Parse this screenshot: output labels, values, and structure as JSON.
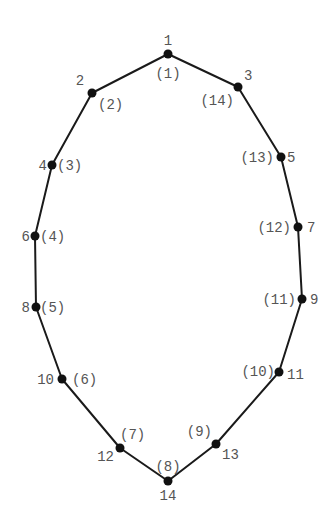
{
  "diagram": {
    "type": "polygon-vertex-numbering",
    "colors": {
      "edge": "#1a1a1a",
      "node": "#111111",
      "label": "#555555",
      "background": "#ffffff"
    },
    "vertices": [
      {
        "id": "v1",
        "x": 168,
        "y": 54,
        "primary": "1",
        "secondary": "(1)",
        "p_dx": 0,
        "p_dy": -9,
        "p_anchor": "middle",
        "s_dx": 0,
        "s_dy": 24,
        "s_anchor": "middle"
      },
      {
        "id": "v2",
        "x": 92,
        "y": 93,
        "primary": "2",
        "secondary": "(2)",
        "p_dx": -12,
        "p_dy": -8,
        "p_anchor": "middle",
        "s_dx": 6,
        "s_dy": 16,
        "s_anchor": "start"
      },
      {
        "id": "v3",
        "x": 238,
        "y": 87,
        "primary": "3",
        "secondary": "(14)",
        "p_dx": 6,
        "p_dy": -7,
        "p_anchor": "start",
        "s_dx": -4,
        "s_dy": 18,
        "s_anchor": "end"
      },
      {
        "id": "v4",
        "x": 52,
        "y": 165,
        "primary": "4",
        "secondary": "(3)",
        "p_dx": -5,
        "p_dy": 5,
        "p_anchor": "end",
        "s_dx": 5,
        "s_dy": 5,
        "s_anchor": "start"
      },
      {
        "id": "v5",
        "x": 281,
        "y": 157,
        "primary": "5",
        "secondary": "(13)",
        "p_dx": 6,
        "p_dy": 5,
        "p_anchor": "start",
        "s_dx": -7,
        "s_dy": 5,
        "s_anchor": "end"
      },
      {
        "id": "v6",
        "x": 35,
        "y": 236,
        "primary": "6",
        "secondary": "(4)",
        "p_dx": -5,
        "p_dy": 5,
        "p_anchor": "end",
        "s_dx": 5,
        "s_dy": 5,
        "s_anchor": "start"
      },
      {
        "id": "v7",
        "x": 298,
        "y": 227,
        "primary": "7",
        "secondary": "(12)",
        "p_dx": 9,
        "p_dy": 5,
        "p_anchor": "start",
        "s_dx": -7,
        "s_dy": 5,
        "s_anchor": "end"
      },
      {
        "id": "v8",
        "x": 36,
        "y": 307,
        "primary": "8",
        "secondary": "(5)",
        "p_dx": -6,
        "p_dy": 5,
        "p_anchor": "end",
        "s_dx": 4,
        "s_dy": 5,
        "s_anchor": "start"
      },
      {
        "id": "v9",
        "x": 302,
        "y": 299,
        "primary": "9",
        "secondary": "(11)",
        "p_dx": 8,
        "p_dy": 5,
        "p_anchor": "start",
        "s_dx": -6,
        "s_dy": 5,
        "s_anchor": "end"
      },
      {
        "id": "v10",
        "x": 62,
        "y": 379,
        "primary": "10",
        "secondary": "(6)",
        "p_dx": -8,
        "p_dy": 5,
        "p_anchor": "end",
        "s_dx": 10,
        "s_dy": 5,
        "s_anchor": "start"
      },
      {
        "id": "v11",
        "x": 279,
        "y": 372,
        "primary": "11",
        "secondary": "(10)",
        "p_dx": 8,
        "p_dy": 7,
        "p_anchor": "start",
        "s_dx": -4,
        "s_dy": 4,
        "s_anchor": "end"
      },
      {
        "id": "v12",
        "x": 120,
        "y": 448,
        "primary": "12",
        "secondary": "(7)",
        "p_dx": -6,
        "p_dy": 13,
        "p_anchor": "end",
        "s_dx": 0,
        "s_dy": -9,
        "s_anchor": "start"
      },
      {
        "id": "v13",
        "x": 216,
        "y": 444,
        "primary": "13",
        "secondary": "(9)",
        "p_dx": 6,
        "p_dy": 15,
        "p_anchor": "start",
        "s_dx": -4,
        "s_dy": -8,
        "s_anchor": "end"
      },
      {
        "id": "v14",
        "x": 168,
        "y": 481,
        "primary": "14",
        "secondary": "(8)",
        "p_dx": 0,
        "p_dy": 19,
        "p_anchor": "middle",
        "s_dx": 0,
        "s_dy": -10,
        "s_anchor": "middle"
      }
    ],
    "polygon_order": [
      "v1",
      "v3",
      "v5",
      "v7",
      "v9",
      "v11",
      "v13",
      "v14",
      "v12",
      "v10",
      "v8",
      "v6",
      "v4",
      "v2"
    ]
  }
}
